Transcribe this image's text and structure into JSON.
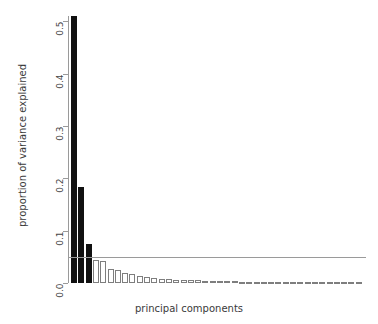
{
  "chart_data": {
    "type": "bar",
    "title": "",
    "subtitle": "",
    "xlabel": "principal components",
    "ylabel": "proportion of variance explained",
    "ylim": [
      0.0,
      0.51
    ],
    "xlim": [
      0,
      40
    ],
    "grid": false,
    "legend": null,
    "y_ticks": [
      {
        "value": 0.0,
        "label": "0.0"
      },
      {
        "value": 0.1,
        "label": "0.1"
      },
      {
        "value": 0.2,
        "label": "0.2"
      },
      {
        "value": 0.3,
        "label": "0.3"
      },
      {
        "value": 0.4,
        "label": "0.4"
      },
      {
        "value": 0.5,
        "label": "0.5"
      }
    ],
    "x_ticks": [],
    "annotations": [
      {
        "kind": "horizontal-line",
        "name": "threshold-line",
        "value": 0.05,
        "label": "",
        "color": "#9a9a9a"
      }
    ],
    "bar_style": {
      "filled_color": "#111111",
      "hollow_fill": "#ffffff",
      "hollow_border": "#7e7e7e",
      "filled_count": 3
    },
    "categories": [
      "PC1",
      "PC2",
      "PC3",
      "PC4",
      "PC5",
      "PC6",
      "PC7",
      "PC8",
      "PC9",
      "PC10",
      "PC11",
      "PC12",
      "PC13",
      "PC14",
      "PC15",
      "PC16",
      "PC17",
      "PC18",
      "PC19",
      "PC20",
      "PC21",
      "PC22",
      "PC23",
      "PC24",
      "PC25",
      "PC26",
      "PC27",
      "PC28",
      "PC29",
      "PC30",
      "PC31",
      "PC32",
      "PC33",
      "PC34",
      "PC35",
      "PC36",
      "PC37",
      "PC38",
      "PC39",
      "PC40"
    ],
    "values": [
      0.51,
      0.183,
      0.074,
      0.043,
      0.042,
      0.026,
      0.024,
      0.019,
      0.018,
      0.013,
      0.011,
      0.01,
      0.0085,
      0.0075,
      0.0065,
      0.006,
      0.0055,
      0.005,
      0.0045,
      0.004,
      0.0035,
      0.0033,
      0.003,
      0.0028,
      0.0025,
      0.0023,
      0.002,
      0.0018,
      0.0016,
      0.0014,
      0.0012,
      0.0011,
      0.001,
      0.0009,
      0.0008,
      0.0007,
      0.0006,
      0.0005,
      0.0004,
      0.0003
    ]
  }
}
